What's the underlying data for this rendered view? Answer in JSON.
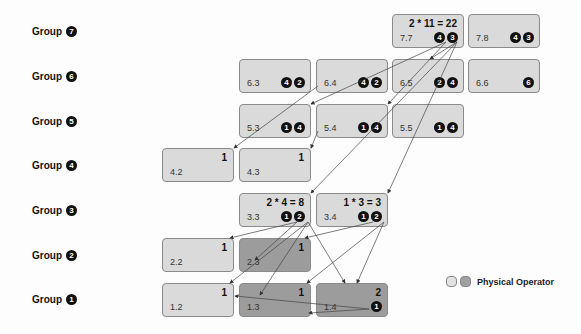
{
  "groups": [
    {
      "label": "Group",
      "num": "7"
    },
    {
      "label": "Group",
      "num": "6"
    },
    {
      "label": "Group",
      "num": "5"
    },
    {
      "label": "Group",
      "num": "4"
    },
    {
      "label": "Group",
      "num": "3"
    },
    {
      "label": "Group",
      "num": "2"
    },
    {
      "label": "Group",
      "num": "1"
    }
  ],
  "boxes": {
    "b77": {
      "id": "7.7",
      "cost": "2 * 11 = 22",
      "refs": [
        "4",
        "3"
      ]
    },
    "b78": {
      "id": "7.8",
      "cost": "",
      "refs": [
        "4",
        "3"
      ]
    },
    "b63": {
      "id": "6.3",
      "cost": "",
      "refs": [
        "4",
        "2"
      ]
    },
    "b64": {
      "id": "6.4",
      "cost": "",
      "refs": [
        "4",
        "2"
      ]
    },
    "b65": {
      "id": "6.5",
      "cost": "",
      "refs": [
        "2",
        "4"
      ]
    },
    "b66": {
      "id": "6.6",
      "cost": "",
      "refs": [
        "6"
      ]
    },
    "b53": {
      "id": "5.3",
      "cost": "",
      "refs": [
        "1",
        "4"
      ]
    },
    "b54": {
      "id": "5.4",
      "cost": "",
      "refs": [
        "1",
        "4"
      ]
    },
    "b55": {
      "id": "5.5",
      "cost": "",
      "refs": [
        "1",
        "4"
      ]
    },
    "b42": {
      "id": "4.2",
      "cost": "1",
      "refs": []
    },
    "b43": {
      "id": "4.3",
      "cost": "1",
      "refs": []
    },
    "b33": {
      "id": "3.3",
      "cost": "2 * 4 = 8",
      "refs": [
        "1",
        "2"
      ]
    },
    "b34": {
      "id": "3.4",
      "cost": "1 * 3 = 3",
      "refs": [
        "1",
        "2"
      ]
    },
    "b22": {
      "id": "2.2",
      "cost": "1",
      "refs": []
    },
    "b23": {
      "id": "2.3",
      "cost": "1",
      "refs": []
    },
    "b12": {
      "id": "1.2",
      "cost": "1",
      "refs": []
    },
    "b13": {
      "id": "1.3",
      "cost": "1",
      "refs": []
    },
    "b14": {
      "id": "1.4",
      "cost": "2",
      "refs": [
        "1"
      ]
    }
  },
  "legend": {
    "label": "Physical Operator",
    "light_color": "#e2e2e2",
    "dark_color": "#a0a0a0"
  }
}
